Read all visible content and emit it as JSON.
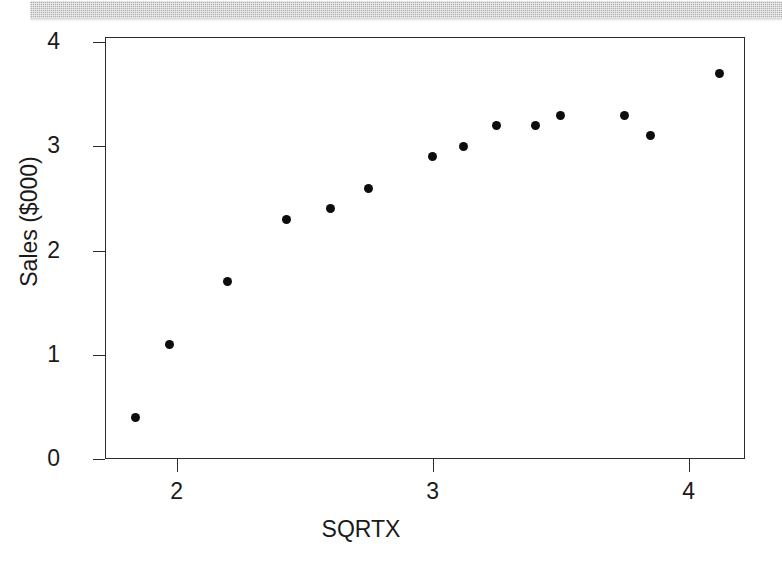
{
  "decor": {
    "top_band_color": "#b4b4b4"
  },
  "chart_data": {
    "type": "scatter",
    "title": "",
    "xlabel": "SQRTX",
    "ylabel": "Sales ($000)",
    "xlim": [
      1.72,
      4.22
    ],
    "ylim": [
      0,
      4.05
    ],
    "xticks": [
      "2",
      "3",
      "4"
    ],
    "xtick_values": [
      2,
      3,
      4
    ],
    "yticks": [
      "0",
      "1",
      "2",
      "3",
      "4"
    ],
    "ytick_values": [
      0,
      1,
      2,
      3,
      4
    ],
    "grid": false,
    "legend": null,
    "marker": {
      "shape": "circle",
      "color": "#0d0d0d",
      "size_px": 9
    },
    "series": [
      {
        "name": "Sales vs SQRTX",
        "points": [
          {
            "x": 1.84,
            "y": 0.4
          },
          {
            "x": 1.97,
            "y": 1.1
          },
          {
            "x": 2.2,
            "y": 1.7
          },
          {
            "x": 2.43,
            "y": 2.3
          },
          {
            "x": 2.6,
            "y": 2.4
          },
          {
            "x": 2.75,
            "y": 2.6
          },
          {
            "x": 3.0,
            "y": 2.9
          },
          {
            "x": 3.12,
            "y": 3.0
          },
          {
            "x": 3.25,
            "y": 3.2
          },
          {
            "x": 3.4,
            "y": 3.2
          },
          {
            "x": 3.5,
            "y": 3.3
          },
          {
            "x": 3.75,
            "y": 3.3
          },
          {
            "x": 3.85,
            "y": 3.1
          },
          {
            "x": 4.12,
            "y": 3.7
          }
        ]
      }
    ]
  }
}
